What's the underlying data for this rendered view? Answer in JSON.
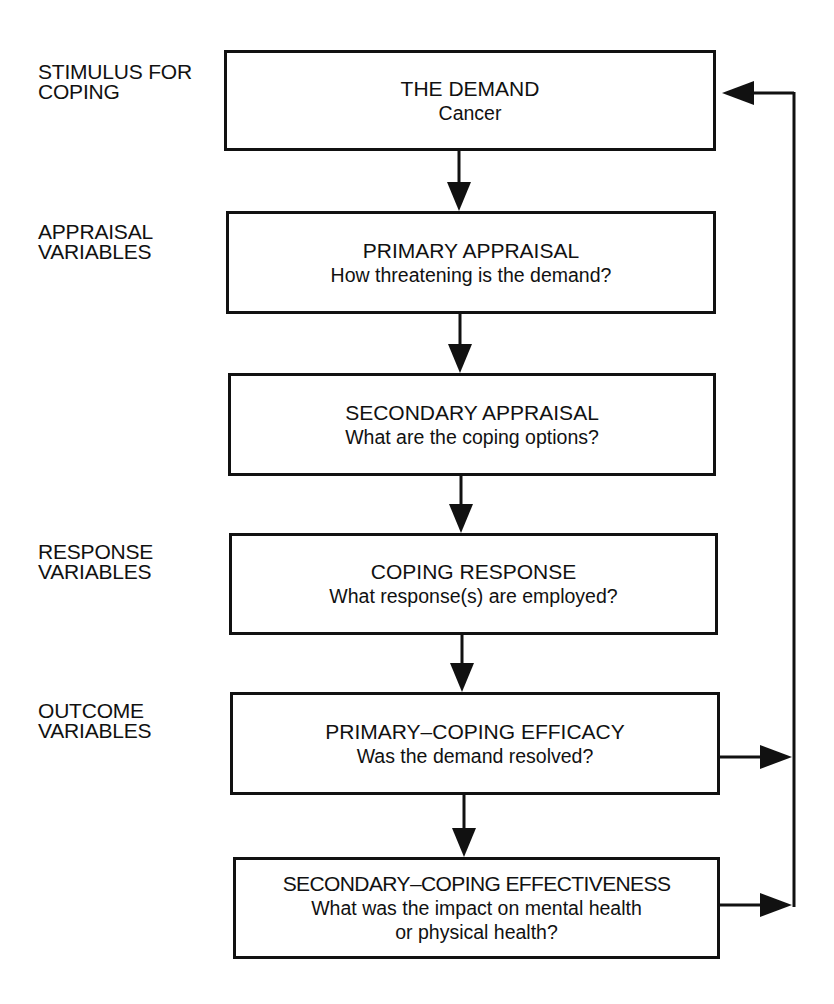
{
  "diagram": {
    "stage_labels": [
      {
        "id": "stimulus",
        "text": "STIMULUS FOR\nCOPING"
      },
      {
        "id": "appraisal",
        "text": "APPRAISAL\nVARIABLES"
      },
      {
        "id": "response",
        "text": "RESPONSE\nVARIABLES"
      },
      {
        "id": "outcome",
        "text": "OUTCOME\nVARIABLES"
      }
    ],
    "boxes": [
      {
        "id": "demand",
        "title": "THE DEMAND",
        "subtitle": "Cancer"
      },
      {
        "id": "primary-appraisal",
        "title": "PRIMARY APPRAISAL",
        "subtitle": "How threatening is the demand?"
      },
      {
        "id": "secondary-appraisal",
        "title": "SECONDARY APPRAISAL",
        "subtitle": "What are the coping options?"
      },
      {
        "id": "coping-response",
        "title": "COPING RESPONSE",
        "subtitle": "What response(s) are employed?"
      },
      {
        "id": "primary-coping-efficacy",
        "title": "PRIMARY–COPING EFFICACY",
        "subtitle": "Was the demand resolved?"
      },
      {
        "id": "secondary-coping-effectiveness",
        "title": "SECONDARY–COPING EFFECTIVENESS",
        "subtitle": "What was the impact on mental health\nor physical health?"
      }
    ],
    "edges": [
      {
        "from": "demand",
        "to": "primary-appraisal"
      },
      {
        "from": "primary-appraisal",
        "to": "secondary-appraisal"
      },
      {
        "from": "secondary-appraisal",
        "to": "coping-response"
      },
      {
        "from": "coping-response",
        "to": "primary-coping-efficacy"
      },
      {
        "from": "primary-coping-efficacy",
        "to": "secondary-coping-effectiveness"
      },
      {
        "from": "primary-coping-efficacy",
        "to": "demand",
        "type": "feedback"
      },
      {
        "from": "secondary-coping-effectiveness",
        "to": "demand",
        "type": "feedback"
      }
    ],
    "colors": {
      "stroke": "#111111",
      "background": "#ffffff"
    }
  }
}
